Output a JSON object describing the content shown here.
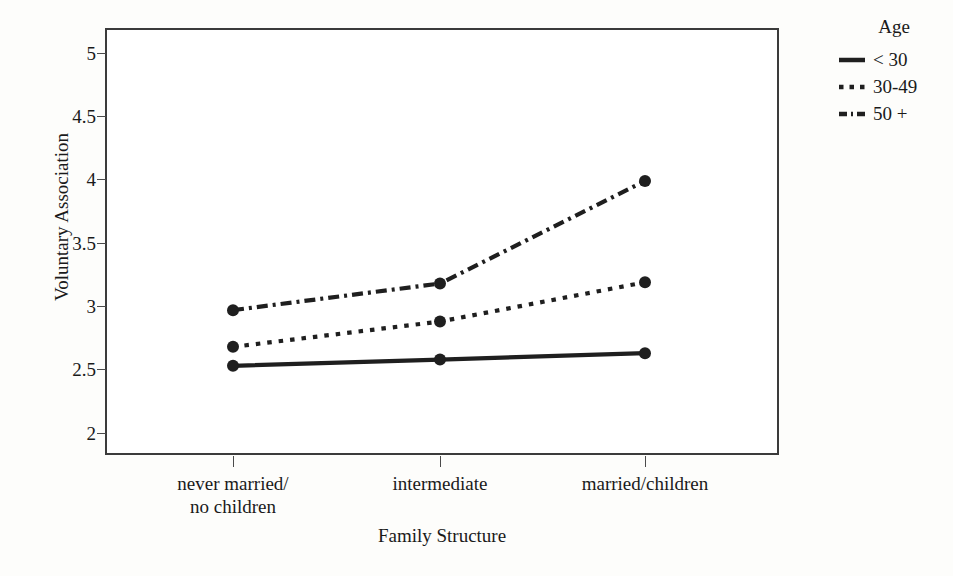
{
  "chart_data": {
    "type": "line",
    "title": "",
    "xlabel": "Family Structure",
    "ylabel": "Voluntary Association",
    "categories": [
      "never married/\nno children",
      "intermediate",
      "married/children"
    ],
    "category_labels_flat": [
      "never married/ no children",
      "intermediate",
      "married/children"
    ],
    "ylim": [
      1.85,
      5.2
    ],
    "yticks": [
      2,
      2.5,
      3,
      3.5,
      4,
      4.5,
      5
    ],
    "ytick_labels": [
      "2",
      "2.5",
      "3",
      "3.5",
      "4",
      "4.5",
      "5"
    ],
    "grid": false,
    "legend_position": "right",
    "legend_title": "Age",
    "series": [
      {
        "name": "< 30",
        "values": [
          2.53,
          2.58,
          2.63
        ],
        "line_style": "solid",
        "color": "#1f1f1f",
        "marker": "circle"
      },
      {
        "name": "30-49",
        "values": [
          2.68,
          2.88,
          3.19
        ],
        "line_style": "dotted",
        "color": "#1f1f1f",
        "marker": "circle"
      },
      {
        "name": "50 +",
        "values": [
          2.97,
          3.18,
          3.99
        ],
        "line_style": "dash-dot",
        "color": "#1f1f1f",
        "marker": "circle"
      }
    ]
  },
  "axes": {
    "ytick_labels": [
      "5",
      "4.5",
      "4",
      "3.5",
      "3",
      "2.5",
      "2"
    ],
    "y_axis_title": "Voluntary Association",
    "x_axis_title": "Family Structure",
    "xtick_labels": [
      "never married/\nno children",
      "intermediate",
      "married/children"
    ]
  },
  "legend": {
    "title": "Age",
    "items": [
      {
        "label": "< 30"
      },
      {
        "label": "30-49"
      },
      {
        "label": "50 +"
      }
    ]
  },
  "colors": {
    "ink": "#1f1f1f",
    "frame": "#3b3b3b",
    "background": "#fdfdfb",
    "plot_background": "#ffffff"
  }
}
